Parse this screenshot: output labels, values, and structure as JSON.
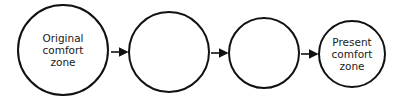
{
  "diagram": {
    "type": "flow",
    "stroke_color": "#111111",
    "background": "#ffffff",
    "nodes": [
      {
        "id": "n1",
        "label_lines": [
          "Original",
          "comfort",
          "zone"
        ],
        "cx": 63,
        "cy": 50,
        "r": 45
      },
      {
        "id": "n2",
        "label_lines": [],
        "cx": 169,
        "cy": 52,
        "r": 40
      },
      {
        "id": "n3",
        "label_lines": [],
        "cx": 264,
        "cy": 53,
        "r": 35
      },
      {
        "id": "n4",
        "label_lines": [
          "Present",
          "comfort",
          "zone"
        ],
        "cx": 352,
        "cy": 54,
        "r": 33
      }
    ],
    "edges": [
      {
        "from": "n1",
        "to": "n2"
      },
      {
        "from": "n2",
        "to": "n3"
      },
      {
        "from": "n3",
        "to": "n4"
      }
    ],
    "n1_label": {
      "l1": "Original",
      "l2": "comfort",
      "l3": "zone"
    },
    "n4_label": {
      "l1": "Present",
      "l2": "comfort",
      "l3": "zone"
    }
  }
}
